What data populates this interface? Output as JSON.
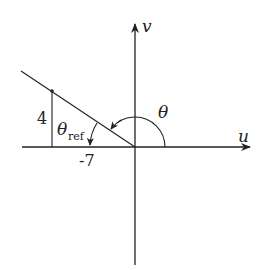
{
  "diagram": {
    "type": "reference-angle",
    "axes": {
      "horizontal_label": "u",
      "vertical_label": "v"
    },
    "point": {
      "u": -7,
      "v": 4
    },
    "labels": {
      "opposite_side": "4",
      "adjacent_side": "-7",
      "angle": "θ",
      "reference_angle_symbol": "θ",
      "reference_angle_subscript": "ref"
    },
    "colors": {
      "stroke": "#222222",
      "background": "#ffffff"
    }
  }
}
